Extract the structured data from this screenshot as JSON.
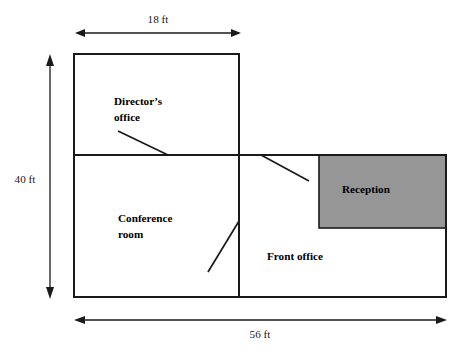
{
  "diagram": {
    "type": "floor-plan",
    "background_color": "#ffffff",
    "wall_color": "#1a1a1a",
    "reception_fill_color": "#969696"
  },
  "rooms": [
    {
      "id": "directors-office",
      "label_lines": [
        "Director’s",
        "office"
      ],
      "label_line1": "Director’s",
      "label_line2": "office",
      "fill": "#ffffff",
      "has_door": true
    },
    {
      "id": "conference-room",
      "label_lines": [
        "Conference",
        "room"
      ],
      "label_line1": "Conference",
      "label_line2": "room",
      "fill": "#ffffff",
      "has_door": true
    },
    {
      "id": "front-office",
      "label_lines": [
        "Front office"
      ],
      "label_line1": "Front office",
      "fill": "#ffffff",
      "has_door": true
    },
    {
      "id": "reception",
      "label_lines": [
        "Reception"
      ],
      "label_line1": "Reception",
      "fill": "#969696",
      "has_door": false
    }
  ],
  "dimensions": [
    {
      "id": "top-width",
      "label": "18 ft",
      "value": 18,
      "unit": "ft",
      "orientation": "horizontal",
      "measures": "directors-office-width"
    },
    {
      "id": "left-height",
      "label": "40 ft",
      "value": 40,
      "unit": "ft",
      "orientation": "vertical",
      "measures": "overall-depth"
    },
    {
      "id": "bottom-width",
      "label": "56 ft",
      "value": 56,
      "unit": "ft",
      "orientation": "horizontal",
      "measures": "overall-width"
    }
  ]
}
